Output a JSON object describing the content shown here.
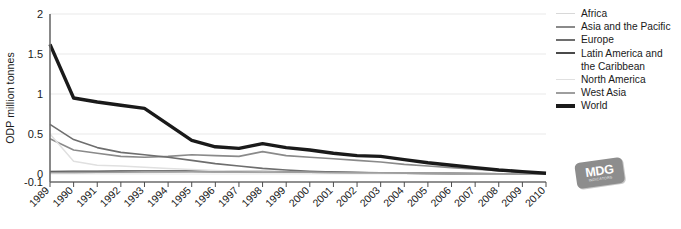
{
  "chart_data": {
    "type": "line",
    "title": "",
    "xlabel": "",
    "ylabel": "ODP million tonnes",
    "ylim": [
      -0.1,
      2
    ],
    "yticks": [
      2,
      1.5,
      1,
      0.5,
      0,
      -0.1
    ],
    "ytick_labels": [
      "2",
      "1.5",
      "1",
      "0.5",
      "0",
      "-0.1"
    ],
    "grid": true,
    "grid_axis": "y",
    "legend_position": "right",
    "categories": [
      "1989",
      "1990",
      "1991",
      "1992",
      "1993",
      "1994",
      "1995",
      "1996",
      "1997",
      "1998",
      "1999",
      "2000",
      "2001",
      "2002",
      "2003",
      "2004",
      "2005",
      "2006",
      "2007",
      "2008",
      "2009",
      "2010"
    ],
    "series": [
      {
        "name": "Africa",
        "color": "#d8d8d8",
        "width": 1.5,
        "values": [
          0.012,
          0.014,
          0.016,
          0.018,
          0.02,
          0.022,
          0.023,
          0.022,
          0.021,
          0.02,
          0.019,
          0.018,
          0.016,
          0.014,
          0.012,
          0.01,
          0.009,
          0.007,
          0.005,
          0.004,
          0.002,
          0.001
        ]
      },
      {
        "name": "Asia and the Pacific",
        "color": "#8a8a8a",
        "width": 1.6,
        "values": [
          0.44,
          0.3,
          0.26,
          0.22,
          0.21,
          0.22,
          0.24,
          0.23,
          0.22,
          0.28,
          0.23,
          0.21,
          0.19,
          0.17,
          0.15,
          0.12,
          0.1,
          0.08,
          0.06,
          0.04,
          0.02,
          0.005
        ]
      },
      {
        "name": "Europe",
        "color": "#6e6e6e",
        "width": 1.6,
        "values": [
          0.62,
          0.43,
          0.33,
          0.27,
          0.24,
          0.21,
          0.17,
          0.13,
          0.1,
          0.07,
          0.05,
          0.035,
          0.025,
          0.018,
          0.013,
          0.009,
          0.007,
          0.005,
          0.004,
          0.003,
          0.002,
          0.001
        ]
      },
      {
        "name": "Latin America and\nthe Caribbean",
        "color": "#4a4a4a",
        "width": 1.7,
        "values": [
          0.03,
          0.032,
          0.034,
          0.035,
          0.036,
          0.036,
          0.035,
          0.033,
          0.031,
          0.029,
          0.026,
          0.023,
          0.02,
          0.017,
          0.014,
          0.011,
          0.009,
          0.007,
          0.005,
          0.003,
          0.002,
          0.001
        ]
      },
      {
        "name": "North America",
        "color": "#e0e0e0",
        "width": 1.5,
        "values": [
          0.5,
          0.16,
          0.11,
          0.1,
          0.085,
          0.07,
          0.055,
          0.045,
          0.035,
          0.028,
          0.022,
          0.018,
          0.015,
          0.012,
          0.01,
          0.008,
          0.006,
          0.005,
          0.004,
          0.003,
          0.002,
          0.001
        ]
      },
      {
        "name": "West Asia",
        "color": "#9e9e9e",
        "width": 1.6,
        "values": [
          0.018,
          0.02,
          0.022,
          0.024,
          0.026,
          0.027,
          0.028,
          0.027,
          0.026,
          0.025,
          0.023,
          0.021,
          0.019,
          0.016,
          0.014,
          0.011,
          0.009,
          0.007,
          0.005,
          0.003,
          0.002,
          0.001
        ]
      },
      {
        "name": "World",
        "color": "#1a1a1a",
        "width": 3.4,
        "values": [
          1.62,
          0.95,
          0.9,
          0.86,
          0.82,
          0.62,
          0.42,
          0.34,
          0.32,
          0.38,
          0.33,
          0.3,
          0.26,
          0.23,
          0.22,
          0.18,
          0.14,
          0.11,
          0.08,
          0.05,
          0.03,
          0.01
        ]
      }
    ]
  },
  "legend": {
    "items": [
      {
        "label": "Africa"
      },
      {
        "label": "Asia and the Pacific"
      },
      {
        "label": "Europe"
      },
      {
        "label": "Latin America and\nthe Caribbean"
      },
      {
        "label": "North America"
      },
      {
        "label": "West Asia"
      },
      {
        "label": "World"
      }
    ]
  },
  "logo": {
    "main": "MDG",
    "sub": "INDICATORS"
  }
}
